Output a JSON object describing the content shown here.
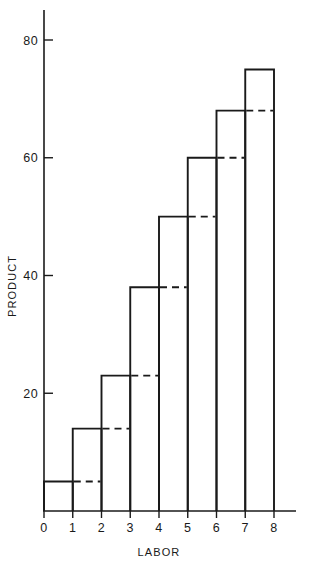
{
  "chart_data": {
    "type": "bar",
    "title": "",
    "subtitle": "",
    "xlabel": "LABOR",
    "ylabel": "PRODUCT",
    "categories": [
      "1",
      "2",
      "3",
      "4",
      "5",
      "6",
      "7",
      "8"
    ],
    "values": [
      5,
      14,
      23,
      38,
      50,
      60,
      68,
      75
    ],
    "x_tick_labels": [
      "0",
      "1",
      "2",
      "3",
      "4",
      "5",
      "6",
      "7",
      "8"
    ],
    "x_tick_values": [
      0,
      1,
      2,
      3,
      4,
      5,
      6,
      7,
      8
    ],
    "y_tick_labels": [
      "20",
      "40",
      "60",
      "80"
    ],
    "y_tick_values": [
      20,
      40,
      60,
      80
    ],
    "xlim": [
      0,
      8
    ],
    "ylim": [
      0,
      84
    ],
    "grid": false,
    "legend": "none",
    "annotations": [
      {
        "kind": "dashed-carry-line",
        "note": "Each bar's top level is repeated as a dashed horizontal line across the following interval"
      }
    ],
    "dashed_carry_values": [
      5,
      14,
      23,
      38,
      50,
      60,
      68
    ],
    "series": [
      {
        "name": "PRODUCT",
        "values": [
          5,
          14,
          23,
          38,
          50,
          60,
          68,
          75
        ],
        "style": "solid-step-bars",
        "color": "#1a1a1a"
      }
    ],
    "colors": {
      "ink": "#1a1a1a",
      "background": "#ffffff"
    }
  }
}
